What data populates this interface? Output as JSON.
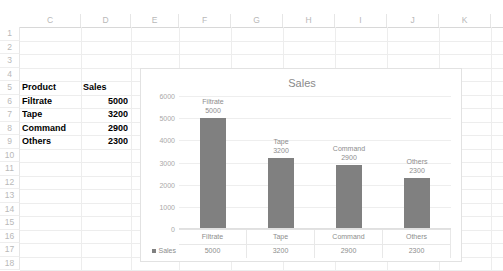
{
  "grid": {
    "columns": [
      {
        "label": "C",
        "left": 20,
        "width": 61
      },
      {
        "label": "D",
        "left": 81,
        "width": 50
      },
      {
        "label": "E",
        "left": 131,
        "width": 48
      },
      {
        "label": "F",
        "left": 179,
        "width": 52
      },
      {
        "label": "G",
        "left": 231,
        "width": 52
      },
      {
        "label": "H",
        "left": 283,
        "width": 52
      },
      {
        "label": "I",
        "left": 335,
        "width": 52
      },
      {
        "label": "J",
        "left": 387,
        "width": 52
      },
      {
        "label": "K",
        "left": 439,
        "width": 52
      }
    ],
    "rows": [
      "1",
      "2",
      "3",
      "4",
      "5",
      "6",
      "7",
      "8",
      "9",
      "10",
      "11",
      "12",
      "13",
      "14",
      "15",
      "16",
      "17",
      "18"
    ]
  },
  "cells": [
    {
      "ref": "C5",
      "text": "Product",
      "col": 0,
      "row": 4,
      "bold": true,
      "align": "left"
    },
    {
      "ref": "D5",
      "text": "Sales",
      "col": 1,
      "row": 4,
      "bold": true,
      "align": "left"
    },
    {
      "ref": "C6",
      "text": "Filtrate",
      "col": 0,
      "row": 5,
      "bold": true,
      "align": "left"
    },
    {
      "ref": "D6",
      "text": "5000",
      "col": 1,
      "row": 5,
      "bold": true,
      "align": "right"
    },
    {
      "ref": "C7",
      "text": "Tape",
      "col": 0,
      "row": 6,
      "bold": true,
      "align": "left"
    },
    {
      "ref": "D7",
      "text": "3200",
      "col": 1,
      "row": 6,
      "bold": true,
      "align": "right"
    },
    {
      "ref": "C8",
      "text": "Command",
      "col": 0,
      "row": 7,
      "bold": true,
      "align": "left"
    },
    {
      "ref": "D8",
      "text": "2900",
      "col": 1,
      "row": 7,
      "bold": true,
      "align": "right"
    },
    {
      "ref": "C9",
      "text": "Others",
      "col": 0,
      "row": 8,
      "bold": true,
      "align": "left"
    },
    {
      "ref": "D9",
      "text": "2300",
      "col": 1,
      "row": 8,
      "bold": true,
      "align": "right"
    }
  ],
  "chart_data": {
    "type": "bar",
    "title": "Sales",
    "xlabel": "",
    "ylabel": "",
    "categories": [
      "Filtrate",
      "Tape",
      "Command",
      "Others"
    ],
    "values": [
      5000,
      3200,
      2900,
      2300
    ],
    "series": [
      {
        "name": "Sales",
        "values": [
          5000,
          3200,
          2900,
          2300
        ]
      }
    ],
    "ylim": [
      0,
      6000
    ],
    "yticks": [
      "6000",
      "5000",
      "4000",
      "3000",
      "2000",
      "1000",
      "0"
    ],
    "grid": true,
    "legend_position": "data-table",
    "data_labels": [
      "5000",
      "3200",
      "2900",
      "2300"
    ],
    "bar_color": "#808080",
    "show_data_table": true
  }
}
